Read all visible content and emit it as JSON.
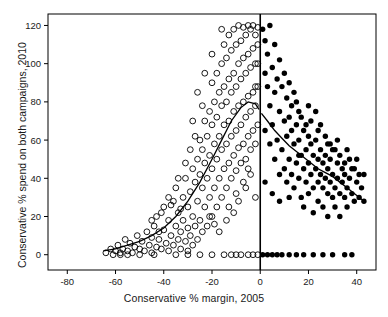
{
  "chart_data": {
    "type": "scatter",
    "title": "",
    "xlabel": "Conservative % margin, 2005",
    "ylabel": "Conservative % spend on both campaigns, 2010",
    "xlim": [
      -88,
      48
    ],
    "ylim": [
      -8,
      126
    ],
    "xticks": [
      -80,
      -60,
      -40,
      -20,
      0,
      20,
      40
    ],
    "yticks": [
      0,
      20,
      40,
      60,
      80,
      100,
      120
    ],
    "grid": false,
    "legend": null,
    "annotations": [
      {
        "name": "vertical-zero-line",
        "x": 0,
        "style": "solid-black"
      },
      {
        "name": "lowess-smoother-left",
        "style": "solid-curve"
      },
      {
        "name": "lowess-smoother-right",
        "style": "solid-curve"
      }
    ],
    "series": [
      {
        "name": "Conservative lost 2005 (open circles)",
        "marker": "open-circle",
        "points": [
          [
            -64,
            1
          ],
          [
            -62,
            3
          ],
          [
            -61,
            0
          ],
          [
            -60,
            2
          ],
          [
            -59,
            5
          ],
          [
            -58,
            1
          ],
          [
            -57,
            3
          ],
          [
            -56,
            8
          ],
          [
            -55,
            2
          ],
          [
            -54,
            6
          ],
          [
            -53,
            1
          ],
          [
            -52,
            4
          ],
          [
            -51,
            10
          ],
          [
            -50,
            3
          ],
          [
            -49,
            7
          ],
          [
            -48,
            2
          ],
          [
            -47,
            12
          ],
          [
            -46,
            5
          ],
          [
            -45,
            9
          ],
          [
            -45,
            1
          ],
          [
            -44,
            15
          ],
          [
            -43,
            4
          ],
          [
            -43,
            20
          ],
          [
            -42,
            8
          ],
          [
            -41,
            3
          ],
          [
            -40,
            13
          ],
          [
            -40,
            25
          ],
          [
            -39,
            6
          ],
          [
            -38,
            18
          ],
          [
            -38,
            2
          ],
          [
            -37,
            10
          ],
          [
            -36,
            28
          ],
          [
            -36,
            5
          ],
          [
            -35,
            15
          ],
          [
            -35,
            35
          ],
          [
            -34,
            8
          ],
          [
            -34,
            22
          ],
          [
            -33,
            12
          ],
          [
            -33,
            3
          ],
          [
            -32,
            30
          ],
          [
            -32,
            18
          ],
          [
            -31,
            7
          ],
          [
            -31,
            40
          ],
          [
            -30,
            14
          ],
          [
            -30,
            25
          ],
          [
            -30,
            2
          ],
          [
            -29,
            33
          ],
          [
            -29,
            10
          ],
          [
            -28,
            45
          ],
          [
            -28,
            20
          ],
          [
            -28,
            5
          ],
          [
            -27,
            38
          ],
          [
            -27,
            15
          ],
          [
            -26,
            50
          ],
          [
            -26,
            28
          ],
          [
            -26,
            8
          ],
          [
            -25,
            42
          ],
          [
            -25,
            18
          ],
          [
            -25,
            60
          ],
          [
            -24,
            35
          ],
          [
            -24,
            12
          ],
          [
            -24,
            55
          ],
          [
            -23,
            48
          ],
          [
            -23,
            25
          ],
          [
            -23,
            70
          ],
          [
            -22,
            40
          ],
          [
            -22,
            15
          ],
          [
            -22,
            62
          ],
          [
            -21,
            52
          ],
          [
            -21,
            30
          ],
          [
            -21,
            75
          ],
          [
            -20,
            45
          ],
          [
            -20,
            20
          ],
          [
            -20,
            68
          ],
          [
            -20,
            90
          ],
          [
            -19,
            58
          ],
          [
            -19,
            35
          ],
          [
            -19,
            80
          ],
          [
            -18,
            50
          ],
          [
            -18,
            25
          ],
          [
            -18,
            72
          ],
          [
            -18,
            95
          ],
          [
            -17,
            62
          ],
          [
            -17,
            40
          ],
          [
            -17,
            85
          ],
          [
            -16,
            55
          ],
          [
            -16,
            30
          ],
          [
            -16,
            78
          ],
          [
            -16,
            100
          ],
          [
            -15,
            68
          ],
          [
            -15,
            45
          ],
          [
            -15,
            88
          ],
          [
            -15,
            110
          ],
          [
            -14,
            58
          ],
          [
            -14,
            35
          ],
          [
            -14,
            80
          ],
          [
            -14,
            103
          ],
          [
            -13,
            70
          ],
          [
            -13,
            48
          ],
          [
            -13,
            92
          ],
          [
            -13,
            115
          ],
          [
            -12,
            62
          ],
          [
            -12,
            40
          ],
          [
            -12,
            85
          ],
          [
            -12,
            107
          ],
          [
            -11,
            75
          ],
          [
            -11,
            52
          ],
          [
            -11,
            95
          ],
          [
            -11,
            118
          ],
          [
            -10,
            65
          ],
          [
            -10,
            44
          ],
          [
            -10,
            88
          ],
          [
            -10,
            110
          ],
          [
            -9,
            78
          ],
          [
            -9,
            56
          ],
          [
            -9,
            100
          ],
          [
            -9,
            120
          ],
          [
            -8,
            68
          ],
          [
            -8,
            48
          ],
          [
            -8,
            92
          ],
          [
            -8,
            112
          ],
          [
            -7,
            80
          ],
          [
            -7,
            58
          ],
          [
            -7,
            103
          ],
          [
            -7,
            119
          ],
          [
            -6,
            72
          ],
          [
            -6,
            50
          ],
          [
            -6,
            95
          ],
          [
            -6,
            115
          ],
          [
            -5,
            83
          ],
          [
            -5,
            62
          ],
          [
            -5,
            105
          ],
          [
            -5,
            120
          ],
          [
            -4,
            75
          ],
          [
            -4,
            55
          ],
          [
            -4,
            98
          ],
          [
            -4,
            118
          ],
          [
            -3,
            85
          ],
          [
            -3,
            65
          ],
          [
            -3,
            108
          ],
          [
            -3,
            120
          ],
          [
            -2,
            78
          ],
          [
            -2,
            58
          ],
          [
            -2,
            100
          ],
          [
            -2,
            115
          ],
          [
            -1,
            88
          ],
          [
            -1,
            68
          ],
          [
            -1,
            110
          ],
          [
            -1,
            119
          ],
          [
            -35,
            0
          ],
          [
            -30,
            0
          ],
          [
            -25,
            0
          ],
          [
            -20,
            0
          ],
          [
            -15,
            0
          ],
          [
            -12,
            0
          ],
          [
            -10,
            0
          ],
          [
            -8,
            0
          ],
          [
            -5,
            0
          ],
          [
            -3,
            0
          ],
          [
            -1,
            0
          ],
          [
            -44,
            0
          ],
          [
            -50,
            0
          ],
          [
            -55,
            0
          ],
          [
            -58,
            0
          ],
          [
            -42,
            12
          ],
          [
            -38,
            30
          ],
          [
            -33,
            24
          ],
          [
            -29,
            55
          ],
          [
            -27,
            62
          ],
          [
            -24,
            78
          ],
          [
            -21,
            20
          ],
          [
            -19,
            16
          ],
          [
            -17,
            12
          ],
          [
            -14,
            18
          ],
          [
            -11,
            22
          ],
          [
            -9,
            28
          ],
          [
            -6,
            35
          ],
          [
            -4,
            42
          ],
          [
            -2,
            30
          ],
          [
            -45,
            18
          ],
          [
            -41,
            22
          ],
          [
            -37,
            26
          ],
          [
            -34,
            40
          ],
          [
            -31,
            48
          ],
          [
            -28,
            70
          ],
          [
            -26,
            85
          ],
          [
            -23,
            95
          ],
          [
            -20,
            105
          ],
          [
            -16,
            118
          ],
          [
            -13,
            25
          ],
          [
            -10,
            32
          ],
          [
            -7,
            38
          ],
          [
            -5,
            45
          ],
          [
            -2,
            88
          ],
          [
            -1,
            100
          ]
        ]
      },
      {
        "name": "Conservative won 2005 (filled circles)",
        "marker": "filled-circle",
        "points": [
          [
            1,
            118
          ],
          [
            2,
            112
          ],
          [
            2,
            95
          ],
          [
            3,
            105
          ],
          [
            3,
            88
          ],
          [
            4,
            120
          ],
          [
            4,
            78
          ],
          [
            5,
            98
          ],
          [
            5,
            68
          ],
          [
            6,
            110
          ],
          [
            6,
            85
          ],
          [
            7,
            92
          ],
          [
            7,
            60
          ],
          [
            8,
            102
          ],
          [
            8,
            75
          ],
          [
            9,
            88
          ],
          [
            9,
            55
          ],
          [
            10,
            95
          ],
          [
            10,
            70
          ],
          [
            10,
            45
          ],
          [
            11,
            82
          ],
          [
            11,
            62
          ],
          [
            12,
            90
          ],
          [
            12,
            50
          ],
          [
            12,
            72
          ],
          [
            13,
            78
          ],
          [
            13,
            42
          ],
          [
            14,
            85
          ],
          [
            14,
            58
          ],
          [
            14,
            35
          ],
          [
            15,
            68
          ],
          [
            15,
            48
          ],
          [
            16,
            75
          ],
          [
            16,
            40
          ],
          [
            16,
            60
          ],
          [
            17,
            52
          ],
          [
            17,
            30
          ],
          [
            18,
            65
          ],
          [
            18,
            45
          ],
          [
            18,
            25
          ],
          [
            19,
            55
          ],
          [
            19,
            38
          ],
          [
            20,
            62
          ],
          [
            20,
            48
          ],
          [
            20,
            32
          ],
          [
            21,
            42
          ],
          [
            21,
            58
          ],
          [
            22,
            52
          ],
          [
            22,
            35
          ],
          [
            22,
            22
          ],
          [
            23,
            45
          ],
          [
            23,
            60
          ],
          [
            24,
            38
          ],
          [
            24,
            50
          ],
          [
            24,
            28
          ],
          [
            25,
            42
          ],
          [
            25,
            55
          ],
          [
            26,
            35
          ],
          [
            26,
            48
          ],
          [
            26,
            25
          ],
          [
            27,
            40
          ],
          [
            27,
            52
          ],
          [
            28,
            32
          ],
          [
            28,
            45
          ],
          [
            28,
            20
          ],
          [
            29,
            38
          ],
          [
            29,
            50
          ],
          [
            30,
            30
          ],
          [
            30,
            42
          ],
          [
            30,
            55
          ],
          [
            31,
            35
          ],
          [
            31,
            25
          ],
          [
            32,
            40
          ],
          [
            32,
            48
          ],
          [
            33,
            32
          ],
          [
            33,
            20
          ],
          [
            34,
            38
          ],
          [
            34,
            45
          ],
          [
            35,
            30
          ],
          [
            35,
            42
          ],
          [
            36,
            35
          ],
          [
            36,
            25
          ],
          [
            37,
            40
          ],
          [
            38,
            32
          ],
          [
            38,
            45
          ],
          [
            39,
            28
          ],
          [
            40,
            38
          ],
          [
            41,
            30
          ],
          [
            42,
            35
          ],
          [
            43,
            42
          ],
          [
            1,
            0
          ],
          [
            3,
            0
          ],
          [
            5,
            0
          ],
          [
            7,
            0
          ],
          [
            9,
            0
          ],
          [
            12,
            0
          ],
          [
            15,
            0
          ],
          [
            18,
            0
          ],
          [
            22,
            0
          ],
          [
            26,
            0
          ],
          [
            30,
            0
          ],
          [
            35,
            0
          ],
          [
            38,
            0
          ],
          [
            2,
            65
          ],
          [
            4,
            58
          ],
          [
            6,
            50
          ],
          [
            8,
            42
          ],
          [
            11,
            38
          ],
          [
            13,
            65
          ],
          [
            15,
            80
          ],
          [
            17,
            72
          ],
          [
            19,
            68
          ],
          [
            21,
            70
          ],
          [
            23,
            75
          ],
          [
            25,
            68
          ],
          [
            27,
            62
          ],
          [
            29,
            58
          ],
          [
            31,
            55
          ],
          [
            33,
            52
          ],
          [
            35,
            48
          ],
          [
            37,
            50
          ],
          [
            39,
            45
          ],
          [
            41,
            42
          ],
          [
            2,
            38
          ],
          [
            5,
            32
          ],
          [
            8,
            28
          ],
          [
            12,
            30
          ],
          [
            16,
            52
          ],
          [
            20,
            78
          ],
          [
            24,
            65
          ],
          [
            28,
            58
          ],
          [
            32,
            60
          ],
          [
            36,
            55
          ],
          [
            40,
            50
          ],
          [
            43,
            28
          ]
        ]
      }
    ]
  }
}
